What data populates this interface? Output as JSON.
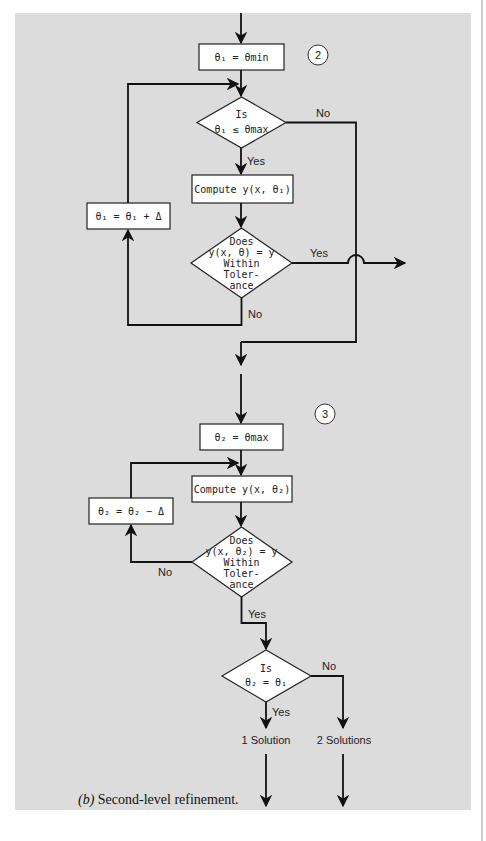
{
  "figure": {
    "caption": "(b) Second-level refinement.",
    "caption_prefix": "(b)",
    "caption_body": " Second-level refinement."
  },
  "colors": {
    "panel_background": "#dcdcdc",
    "node_fill": "#ffffff",
    "stroke": "#111111"
  },
  "section_2": {
    "marker": "2",
    "init_box": "θ₁ = θmin",
    "check_diamond": {
      "line1": "Is",
      "line2": "θ₁ ≤ θmax"
    },
    "check_yes": "Yes",
    "check_no": "No",
    "compute_box": "Compute y(x, θ₁)",
    "tolerance_diamond": {
      "line1": "Does",
      "line2": "y(x, θ) = y",
      "line3": "Within",
      "line4": "Toler-",
      "line5": "ance"
    },
    "tolerance_yes": "Yes",
    "tolerance_no": "No",
    "increment_box": "θ₁ = θ₁ + Δ"
  },
  "section_3": {
    "marker": "3",
    "init_box": "θ₂ = θmax",
    "compute_box": "Compute y(x, θ₂)",
    "decrement_box": "θ₂ = θ₂ − Δ",
    "tolerance_diamond": {
      "line1": "Does",
      "line2": "y(x, θ₂) = y",
      "line3": "Within",
      "line4": "Toler-",
      "line5": "ance"
    },
    "tolerance_yes": "Yes",
    "tolerance_no": "No",
    "equal_diamond": {
      "line1": "Is",
      "line2": "θ₂ = θ₁"
    },
    "equal_yes": "Yes",
    "equal_no": "No",
    "outcome_one": "1 Solution",
    "outcome_two": "2 Solutions"
  }
}
